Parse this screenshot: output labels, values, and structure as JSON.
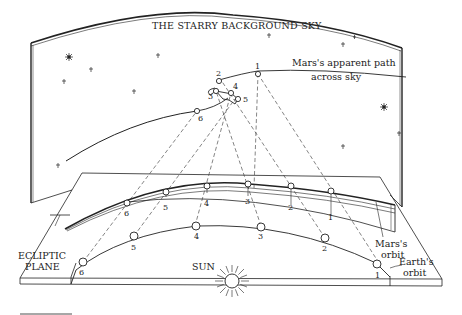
{
  "diagram": {
    "type": "astronomy-illustration",
    "title": "THE STARRY BACKGROUND SKY",
    "labels": {
      "mars_path_line1": "Mars's apparent path",
      "mars_path_line2": "across sky",
      "ecliptic_line1": "ECLIPTIC",
      "ecliptic_line2": "PLANE",
      "sun": "SUN",
      "mars_orbit_line1": "Mars's",
      "mars_orbit_line2": "orbit",
      "earth_orbit_line1": "Earth's",
      "earth_orbit_line2": "orbit"
    },
    "sky_positions": [
      "1",
      "2",
      "3",
      "4",
      "5",
      "6"
    ],
    "mars_positions": [
      "1",
      "2",
      "3",
      "4",
      "5",
      "6"
    ],
    "earth_positions": [
      "1",
      "2",
      "3",
      "4",
      "5",
      "6"
    ],
    "colors": {
      "ink": "#222222",
      "background": "#ffffff"
    }
  }
}
